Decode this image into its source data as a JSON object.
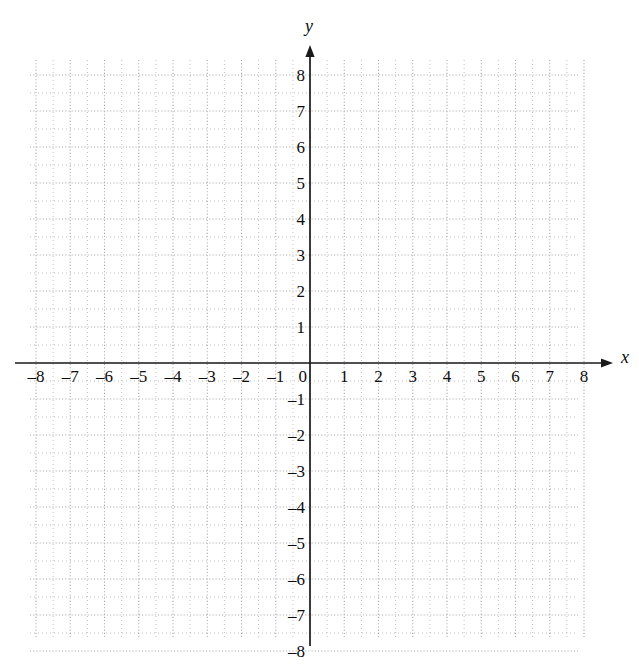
{
  "chart_data": {
    "type": "scatter",
    "title": "",
    "subtitle": "",
    "xlabel": "x",
    "ylabel": "y",
    "xlim": [
      -8,
      8
    ],
    "ylim": [
      -8,
      8
    ],
    "grid": true,
    "grid_style": "dotted",
    "minor_grid_step": 0.5,
    "major_grid_step": 1,
    "legend": null,
    "series": [],
    "x_ticks": [
      -8,
      -7,
      -6,
      -5,
      -4,
      -3,
      -2,
      -1,
      0,
      1,
      2,
      3,
      4,
      5,
      6,
      7,
      8
    ],
    "y_ticks": [
      -8,
      -7,
      -6,
      -5,
      -4,
      -3,
      -2,
      -1,
      1,
      2,
      3,
      4,
      5,
      6,
      7,
      8
    ],
    "x_tick_labels": [
      "–8",
      "–7",
      "–6",
      "–5",
      "–4",
      "–3",
      "–2",
      "–1",
      "0",
      "1",
      "2",
      "3",
      "4",
      "5",
      "6",
      "7",
      "8"
    ],
    "y_tick_labels": [
      "–8",
      "–7",
      "–6",
      "–5",
      "–4",
      "–3",
      "–2",
      "–1",
      "1",
      "2",
      "3",
      "4",
      "5",
      "6",
      "7",
      "8"
    ],
    "origin_label": "0",
    "colors": {
      "axis": "#1a1a1a",
      "grid_dot": "#a8a8a8",
      "text": "#0d0d0d",
      "background": "#ffffff"
    },
    "axis_arrows": {
      "x_positive": true,
      "x_negative": false,
      "y_positive": true,
      "y_negative": false
    }
  },
  "geometry": {
    "origin_x": 310,
    "origin_y": 363,
    "unit_x": 34.25,
    "unit_y": 36.0,
    "grid_left": 30,
    "grid_right": 578,
    "grid_top": 60,
    "grid_bottom": 637,
    "x_axis_start": 15,
    "x_axis_arrow_tip": 613,
    "y_axis_arrow_tip": 45,
    "y_axis_end": 646
  },
  "axis_labels": {
    "x": "x",
    "y": "y"
  }
}
